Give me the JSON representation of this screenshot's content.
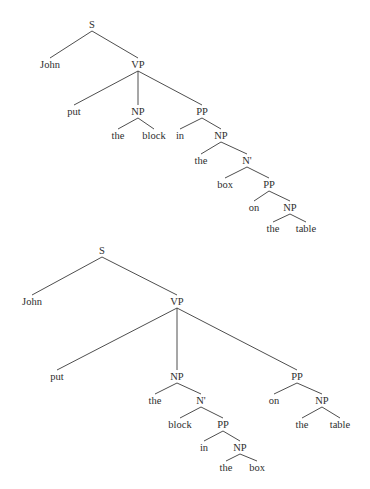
{
  "figure": {
    "background": "#ffffff",
    "ink_color": "#2e2e2e",
    "trees": [
      {
        "id": "tree-1",
        "description": "John put the block in the box on the table (PP attached inside NP 'the box')",
        "nodes": [
          {
            "id": "S",
            "label": "S",
            "x": 92,
            "y": 28
          },
          {
            "id": "John",
            "label": "John",
            "x": 50,
            "y": 68
          },
          {
            "id": "VP",
            "label": "VP",
            "x": 138,
            "y": 68
          },
          {
            "id": "put",
            "label": "put",
            "x": 74,
            "y": 115
          },
          {
            "id": "NP1",
            "label": "NP",
            "x": 138,
            "y": 115
          },
          {
            "id": "PP1",
            "label": "PP",
            "x": 202,
            "y": 115
          },
          {
            "id": "the1",
            "label": "the",
            "x": 118,
            "y": 139
          },
          {
            "id": "block",
            "label": "block",
            "x": 154,
            "y": 139
          },
          {
            "id": "in",
            "label": "in",
            "x": 180,
            "y": 139
          },
          {
            "id": "NP2",
            "label": "NP",
            "x": 221,
            "y": 139
          },
          {
            "id": "the2",
            "label": "the",
            "x": 201,
            "y": 164
          },
          {
            "id": "Nbar",
            "label": "N'",
            "x": 247,
            "y": 164
          },
          {
            "id": "box",
            "label": "box",
            "x": 225,
            "y": 188
          },
          {
            "id": "PP2",
            "label": "PP",
            "x": 269,
            "y": 188
          },
          {
            "id": "on",
            "label": "on",
            "x": 254,
            "y": 211
          },
          {
            "id": "NP3",
            "label": "NP",
            "x": 290,
            "y": 211
          },
          {
            "id": "the3",
            "label": "the",
            "x": 273,
            "y": 232
          },
          {
            "id": "table",
            "label": "table",
            "x": 306,
            "y": 232
          }
        ],
        "edges": [
          [
            "S",
            "John"
          ],
          [
            "S",
            "VP"
          ],
          [
            "VP",
            "put"
          ],
          [
            "VP",
            "NP1"
          ],
          [
            "VP",
            "PP1"
          ],
          [
            "NP1",
            "the1"
          ],
          [
            "NP1",
            "block"
          ],
          [
            "PP1",
            "in"
          ],
          [
            "PP1",
            "NP2"
          ],
          [
            "NP2",
            "the2"
          ],
          [
            "NP2",
            "Nbar"
          ],
          [
            "Nbar",
            "box"
          ],
          [
            "Nbar",
            "PP2"
          ],
          [
            "PP2",
            "on"
          ],
          [
            "PP2",
            "NP3"
          ],
          [
            "NP3",
            "the3"
          ],
          [
            "NP3",
            "table"
          ]
        ]
      },
      {
        "id": "tree-2",
        "description": "John put the block in the box on the table (PP 'in the box' inside NP, PP 'on the table' attached to VP)",
        "nodes": [
          {
            "id": "S",
            "label": "S",
            "x": 102,
            "y": 254
          },
          {
            "id": "John",
            "label": "John",
            "x": 32,
            "y": 305
          },
          {
            "id": "VP",
            "label": "VP",
            "x": 177,
            "y": 305
          },
          {
            "id": "put",
            "label": "put",
            "x": 57,
            "y": 380
          },
          {
            "id": "NP1",
            "label": "NP",
            "x": 177,
            "y": 380
          },
          {
            "id": "PP1",
            "label": "PP",
            "x": 297,
            "y": 380
          },
          {
            "id": "the1",
            "label": "the",
            "x": 155,
            "y": 404
          },
          {
            "id": "Nbar",
            "label": "N'",
            "x": 201,
            "y": 404
          },
          {
            "id": "on",
            "label": "on",
            "x": 274,
            "y": 404
          },
          {
            "id": "NP3",
            "label": "NP",
            "x": 322,
            "y": 404
          },
          {
            "id": "block",
            "label": "block",
            "x": 180,
            "y": 428
          },
          {
            "id": "PP2",
            "label": "PP",
            "x": 223,
            "y": 428
          },
          {
            "id": "the3",
            "label": "the",
            "x": 302,
            "y": 428
          },
          {
            "id": "table",
            "label": "table",
            "x": 340,
            "y": 428
          },
          {
            "id": "in",
            "label": "in",
            "x": 204,
            "y": 451
          },
          {
            "id": "NP2",
            "label": "NP",
            "x": 240,
            "y": 451
          },
          {
            "id": "the2",
            "label": "the",
            "x": 226,
            "y": 471
          },
          {
            "id": "box",
            "label": "box",
            "x": 257,
            "y": 471
          }
        ],
        "edges": [
          [
            "S",
            "John"
          ],
          [
            "S",
            "VP"
          ],
          [
            "VP",
            "put"
          ],
          [
            "VP",
            "NP1"
          ],
          [
            "VP",
            "PP1"
          ],
          [
            "NP1",
            "the1"
          ],
          [
            "NP1",
            "Nbar"
          ],
          [
            "Nbar",
            "block"
          ],
          [
            "Nbar",
            "PP2"
          ],
          [
            "PP2",
            "in"
          ],
          [
            "PP2",
            "NP2"
          ],
          [
            "NP2",
            "the2"
          ],
          [
            "NP2",
            "box"
          ],
          [
            "PP1",
            "on"
          ],
          [
            "PP1",
            "NP3"
          ],
          [
            "NP3",
            "the3"
          ],
          [
            "NP3",
            "table"
          ]
        ]
      }
    ]
  }
}
